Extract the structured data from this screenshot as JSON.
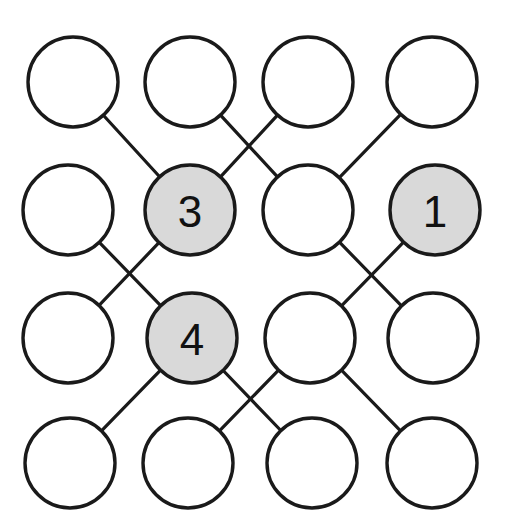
{
  "diagram": {
    "type": "node-link-grid",
    "title": "",
    "canvas": {
      "width": 506,
      "height": 527,
      "background": "#ffffff"
    },
    "style": {
      "node_radius": 45,
      "node_fill_plain": "#ffffff",
      "node_fill_marked": "#d9d9d9",
      "node_stroke": "#1a1a1a",
      "node_stroke_width": 3.4,
      "edge_stroke": "#1a1a1a",
      "edge_stroke_width": 3.2,
      "label_font_size": 44,
      "label_color": "#111111"
    },
    "grid": {
      "rows": 4,
      "cols": 4
    },
    "nodes": [
      {
        "id": "r1c1",
        "row": 1,
        "col": 1,
        "cx": 73,
        "cy": 82,
        "r": 45,
        "label": "",
        "marked": false
      },
      {
        "id": "r1c2",
        "row": 1,
        "col": 2,
        "cx": 190,
        "cy": 82,
        "r": 45,
        "label": "",
        "marked": false
      },
      {
        "id": "r1c3",
        "row": 1,
        "col": 3,
        "cx": 308,
        "cy": 82,
        "r": 45,
        "label": "",
        "marked": false
      },
      {
        "id": "r1c4",
        "row": 1,
        "col": 4,
        "cx": 432,
        "cy": 82,
        "r": 45,
        "label": "",
        "marked": false
      },
      {
        "id": "r2c1",
        "row": 2,
        "col": 1,
        "cx": 68,
        "cy": 210,
        "r": 45,
        "label": "",
        "marked": false
      },
      {
        "id": "r2c2",
        "row": 2,
        "col": 2,
        "cx": 190,
        "cy": 210,
        "r": 45,
        "label": "3",
        "marked": true
      },
      {
        "id": "r2c3",
        "row": 2,
        "col": 3,
        "cx": 308,
        "cy": 210,
        "r": 45,
        "label": "",
        "marked": false
      },
      {
        "id": "r2c4",
        "row": 2,
        "col": 4,
        "cx": 435,
        "cy": 210,
        "r": 45,
        "label": "1",
        "marked": true
      },
      {
        "id": "r3c1",
        "row": 3,
        "col": 1,
        "cx": 68,
        "cy": 338,
        "r": 45,
        "label": "",
        "marked": false
      },
      {
        "id": "r3c2",
        "row": 3,
        "col": 2,
        "cx": 192,
        "cy": 338,
        "r": 45,
        "label": "4",
        "marked": true
      },
      {
        "id": "r3c3",
        "row": 3,
        "col": 3,
        "cx": 310,
        "cy": 338,
        "r": 45,
        "label": "",
        "marked": false
      },
      {
        "id": "r3c4",
        "row": 3,
        "col": 4,
        "cx": 433,
        "cy": 338,
        "r": 45,
        "label": "",
        "marked": false
      },
      {
        "id": "r4c1",
        "row": 4,
        "col": 1,
        "cx": 70,
        "cy": 463,
        "r": 45,
        "label": "",
        "marked": false
      },
      {
        "id": "r4c2",
        "row": 4,
        "col": 2,
        "cx": 188,
        "cy": 463,
        "r": 45,
        "label": "",
        "marked": false
      },
      {
        "id": "r4c3",
        "row": 4,
        "col": 3,
        "cx": 312,
        "cy": 463,
        "r": 45,
        "label": "",
        "marked": false
      },
      {
        "id": "r4c4",
        "row": 4,
        "col": 4,
        "cx": 432,
        "cy": 463,
        "r": 45,
        "label": "",
        "marked": false
      }
    ],
    "edges": [
      {
        "from": "r1c1",
        "to": "r2c2"
      },
      {
        "from": "r1c2",
        "to": "r2c3"
      },
      {
        "from": "r1c3",
        "to": "r2c2"
      },
      {
        "from": "r1c4",
        "to": "r2c3"
      },
      {
        "from": "r2c1",
        "to": "r3c2"
      },
      {
        "from": "r2c2",
        "to": "r3c1"
      },
      {
        "from": "r2c3",
        "to": "r3c4"
      },
      {
        "from": "r2c4",
        "to": "r3c3"
      },
      {
        "from": "r3c2",
        "to": "r4c1"
      },
      {
        "from": "r3c2",
        "to": "r4c3"
      },
      {
        "from": "r3c3",
        "to": "r4c2"
      },
      {
        "from": "r3c3",
        "to": "r4c4"
      }
    ],
    "labels_present": [
      "3",
      "1",
      "4"
    ]
  }
}
